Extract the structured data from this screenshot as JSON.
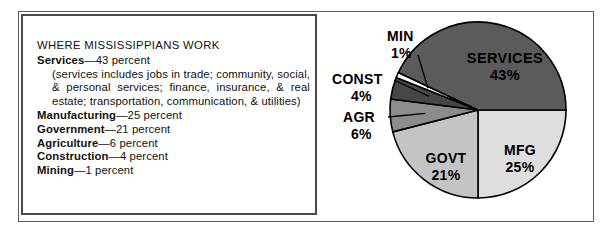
{
  "caption": {
    "title": "WHERE MISSISSIPPIANS WORK",
    "items": [
      {
        "name": "Services",
        "dash": "—",
        "value": "43 percent"
      },
      {
        "name": "Manufacturing",
        "dash": "—",
        "value": "25 percent"
      },
      {
        "name": "Government",
        "dash": "—",
        "value": "21 percent"
      },
      {
        "name": "Agriculture",
        "dash": "—",
        "value": "6 percent"
      },
      {
        "name": "Construction",
        "dash": "—",
        "value": "4 percent"
      },
      {
        "name": "Mining",
        "dash": "—",
        "value": "1 percent"
      }
    ],
    "note_line1": "(services includes jobs in trade; community, social,",
    "note_line2_a": "&",
    "note_line2_b": "personal",
    "note_line2_c": "services;",
    "note_line2_d": "finance,",
    "note_line2_e": "insurance,",
    "note_line2_f": "&",
    "note_line2_g": "real",
    "note_line3": "estate; transportation, communication, & utilities)"
  },
  "chart_data": {
    "type": "pie",
    "title": "WHERE MISSISSIPPIANS WORK",
    "categories": [
      "SERVICES",
      "MFG",
      "GOVT",
      "AGR",
      "CONST",
      "MIN"
    ],
    "values": [
      43,
      25,
      21,
      6,
      4,
      1
    ],
    "unit": "percent",
    "legend": "none",
    "slices": [
      {
        "key": "mfg",
        "label": "MFG",
        "pct_label": "25%",
        "value": 25,
        "color": "#dedede",
        "label_placement": "inside"
      },
      {
        "key": "govt",
        "label": "GOVT",
        "pct_label": "21%",
        "value": 21,
        "color": "#c4c4c4",
        "label_placement": "inside"
      },
      {
        "key": "agr",
        "label": "AGR",
        "pct_label": "6%",
        "value": 6,
        "color": "#8c8c8c",
        "label_placement": "callout-left"
      },
      {
        "key": "const",
        "label": "CONST",
        "pct_label": "4%",
        "value": 4,
        "color": "#474747",
        "label_placement": "callout-left"
      },
      {
        "key": "min",
        "label": "MIN",
        "pct_label": "1%",
        "value": 1,
        "color": "#ffffff",
        "label_placement": "callout-left"
      },
      {
        "key": "services",
        "label": "SERVICES",
        "pct_label": "43%",
        "value": 43,
        "color": "#5b5b5b",
        "label_placement": "inside"
      }
    ],
    "geometry": {
      "center_x": 148,
      "center_y": 110,
      "radius": 88,
      "start_angle_deg": 0,
      "direction": "clockwise"
    },
    "colors": {
      "outline": "#000000",
      "background": "#ffffff",
      "frame": "#5d5d5d",
      "caption_border": "#4a4a4a",
      "text": "#111111"
    }
  }
}
